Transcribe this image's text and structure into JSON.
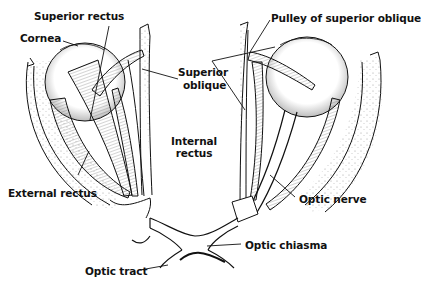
{
  "diagram": {
    "colors": {
      "ink": "#111111",
      "background": "#ffffff",
      "stipple": "#8a8a8a"
    },
    "labels": {
      "superior_rectus": "Superior rectus",
      "cornea": "Cornea",
      "internal_rectus_line1": "Internal",
      "internal_rectus_line2": "rectus",
      "external_rectus": "External rectus",
      "pulley_superior_oblique": "Pulley of superior oblique",
      "superior_oblique_line1": "Superior",
      "superior_oblique_line2": "oblique",
      "optic_nerve": "Optic nerve",
      "optic_chiasma": "Optic chiasma",
      "optic_tract": "Optic tract"
    }
  }
}
